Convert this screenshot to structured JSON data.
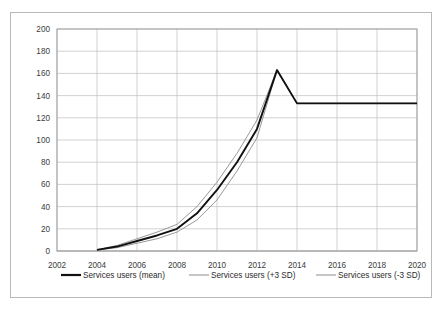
{
  "chart_data": {
    "type": "line",
    "title": "",
    "subtitle": "",
    "xlabel": "",
    "ylabel": "",
    "xlim": [
      2002,
      2020
    ],
    "ylim": [
      0,
      200
    ],
    "grid": true,
    "legend_position": "bottom",
    "x": [
      2002,
      2003,
      2004,
      2005,
      2006,
      2007,
      2008,
      2009,
      2010,
      2011,
      2012,
      2013,
      2014,
      2015,
      2016,
      2017,
      2018,
      2019,
      2020
    ],
    "xticks": [
      "2002",
      "2004",
      "2006",
      "2008",
      "2010",
      "2012",
      "2014",
      "2016",
      "2018",
      "2020"
    ],
    "yticks": [
      "0",
      "20",
      "40",
      "60",
      "80",
      "100",
      "120",
      "140",
      "160",
      "180",
      "200"
    ],
    "series": [
      {
        "name": "Services users (mean)",
        "color": "#111111",
        "width": 1.9,
        "values": [
          null,
          null,
          1,
          4,
          9,
          14,
          20,
          34,
          55,
          80,
          110,
          163,
          133,
          133,
          133,
          133,
          133,
          133,
          133
        ]
      },
      {
        "name": "Services users (+3 SD)",
        "color": "#8d8d8d",
        "width": 0.9,
        "values": [
          null,
          null,
          1,
          5,
          11,
          17,
          24,
          40,
          62,
          88,
          118,
          163,
          133,
          133,
          133,
          133,
          133,
          133,
          133
        ]
      },
      {
        "name": "Services users (-3 SD)",
        "color": "#8d8d8d",
        "width": 0.9,
        "values": [
          null,
          null,
          1,
          3,
          7,
          11,
          17,
          28,
          46,
          72,
          102,
          163,
          133,
          133,
          133,
          133,
          133,
          133,
          133
        ]
      }
    ]
  },
  "legend": {
    "items": [
      {
        "label": "Services users (mean)",
        "color": "#111111",
        "width": 2.2
      },
      {
        "label": "Services users (+3 SD)",
        "color": "#8d8d8d",
        "width": 1.0
      },
      {
        "label": "Services users (-3 SD)",
        "color": "#8d8d8d",
        "width": 1.0
      }
    ]
  }
}
